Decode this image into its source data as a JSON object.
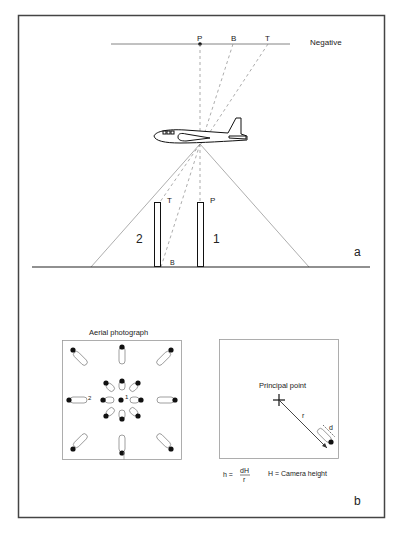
{
  "panel_a": {
    "negative_label": "Negative",
    "negative_points": [
      "P",
      "B",
      "T"
    ],
    "object_1_label": "1",
    "object_2_label": "2",
    "object_1_top_label": "P",
    "object_2_top_label": "T",
    "object_2_base_label": "B",
    "panel_letter": "a"
  },
  "panel_b": {
    "photo_title": "Aerial photograph",
    "photo_object_1_label": "1",
    "photo_object_2_label": "2",
    "principal_point_label": "Principal point",
    "r_label": "r",
    "d_label": "d",
    "formula_lhs": "h =",
    "formula_numerator": "dH",
    "formula_denominator": "r",
    "formula_note": "H = Camera height",
    "panel_letter": "b"
  },
  "colors": {
    "frame": "#444444",
    "line": "#222222",
    "light_line": "#999999",
    "dashed": "#888888"
  }
}
